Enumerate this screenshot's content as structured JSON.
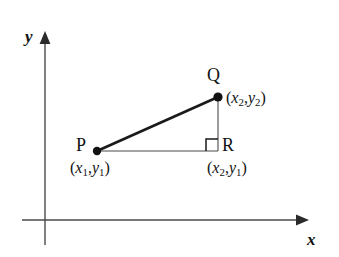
{
  "figure": {
    "name": "distance-formula-right-triangle-diagram",
    "background_color": "#ffffff",
    "ink_color": "#1a1a1a",
    "width": 339,
    "height": 257
  },
  "axes": {
    "x_label": "x",
    "y_label": "y",
    "origin": {
      "x": 45,
      "y": 220
    },
    "x_axis": {
      "start_x": 22,
      "end_x": 300,
      "y": 220,
      "arrow": "right"
    },
    "y_axis": {
      "x": 45,
      "start_y": 245,
      "end_y": 36,
      "arrow": "up"
    }
  },
  "points": {
    "P": {
      "letter": "P",
      "coord_open": "(",
      "coord_x_var": "x",
      "coord_x_sub": "1",
      "coord_comma": ",",
      "coord_y_var": "y",
      "coord_y_sub": "1",
      "coord_close": ")",
      "px": 97,
      "py": 151
    },
    "Q": {
      "letter": "Q",
      "coord_open": "(",
      "coord_x_var": "x",
      "coord_x_sub": "2",
      "coord_comma": ",",
      "coord_y_var": "y",
      "coord_y_sub": "2",
      "coord_close": ")",
      "px": 218,
      "py": 97
    },
    "R": {
      "letter": "R",
      "coord_open": "(",
      "coord_x_var": "x",
      "coord_x_sub": "2",
      "coord_comma": ",",
      "coord_y_var": "y",
      "coord_y_sub": "1",
      "coord_close": ")",
      "px": 218,
      "py": 151
    }
  },
  "segments": {
    "hypotenuse_PQ": {
      "from": "P",
      "to": "Q",
      "thickness": 2.6
    },
    "leg_PR": {
      "from": "P",
      "to": "R",
      "thickness": 1.1
    },
    "leg_QR": {
      "from": "Q",
      "to": "R",
      "thickness": 1.1
    }
  },
  "right_angle_marker": {
    "at": "R",
    "size": 12,
    "left": 206,
    "top": 138
  }
}
